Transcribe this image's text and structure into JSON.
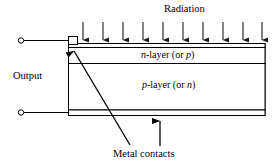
{
  "figure": {
    "type": "semiconductor-photodetector-cross-section",
    "labels": {
      "radiation": "Radiation",
      "output": "Output",
      "metal_contacts": "Metal contacts"
    },
    "layers": [
      {
        "name": "top-metal-contact-strip",
        "label": "",
        "role": "metal contact"
      },
      {
        "name": "n-layer",
        "label_parts": {
          "symbol": "n",
          "text": "-layer (or ",
          "alt_symbol": "p",
          "close": ")"
        },
        "label_plain": "n-layer (or p)"
      },
      {
        "name": "p-layer",
        "label_parts": {
          "symbol": "p",
          "text": "-layer (or ",
          "alt_symbol": "n",
          "close": ")"
        },
        "label_plain": "p-layer (or n)"
      },
      {
        "name": "bottom-metal-contact-strip",
        "label": "",
        "role": "metal contact"
      }
    ],
    "radiation_arrows": {
      "count": 10,
      "direction": "down",
      "x_positions": [
        83,
        103,
        123,
        143,
        163,
        183,
        203,
        223,
        243,
        262
      ],
      "y_start": 22,
      "y_end": 46
    },
    "terminals": [
      {
        "name": "top-output-terminal",
        "x": 20,
        "y": 44
      },
      {
        "name": "bottom-output-terminal",
        "x": 20,
        "y": 114
      }
    ],
    "annotation_leaders": [
      {
        "name": "top-contact-leader",
        "style": "diagonal-arrow",
        "from": [
          128,
          144
        ],
        "to": [
          70,
          52
        ]
      },
      {
        "name": "bottom-contact-leader",
        "style": "vertical-arrow",
        "from": [
          160,
          144
        ],
        "to": [
          160,
          120
        ]
      }
    ],
    "colors": {
      "stroke": "#000000",
      "background": "#ffffff",
      "arrow": "#1a1a1a"
    }
  }
}
